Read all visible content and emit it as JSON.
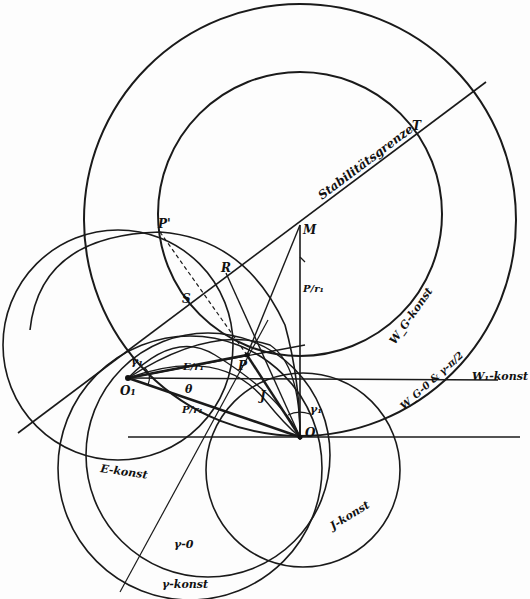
{
  "diagram": {
    "stroke_color": "#1a1a1a",
    "background": "#fdfdfd",
    "points": {
      "O": {
        "label": "O",
        "x": 300,
        "y": 437
      },
      "O1": {
        "label": "O₁",
        "x": 128,
        "y": 378
      },
      "P": {
        "label": "P",
        "x": 247,
        "y": 355
      },
      "P_prime": {
        "label": "P'",
        "x": 160,
        "y": 232
      },
      "M": {
        "label": "M",
        "x": 300,
        "y": 225
      },
      "R": {
        "label": "R",
        "x": 226,
        "y": 273
      },
      "S": {
        "label": "S",
        "x": 183,
        "y": 305
      },
      "T": {
        "label": "T",
        "x": 414,
        "y": 130
      }
    },
    "labels": {
      "stability": "Stabilitätsgrenze",
      "w1_konst": "W₁-konst",
      "wg_konst": "W_G-konst",
      "wg_zero": "W_G-0 & γ-π/2",
      "e_konst": "E-konst",
      "j_konst": "J-konst",
      "gamma_zero": "γ-0",
      "gamma_konst": "γ-konst",
      "p_over_r1": "P/r₁",
      "e_over_r1": "E/r₁",
      "theta": "θ",
      "gamma1_a": "γ₁",
      "gamma1_b": "γ₁",
      "j_sym": "J",
      "p_over_r1_b": "P/r₁"
    },
    "circles": [
      {
        "name": "w1-konst",
        "cx": 300,
        "cy": 220,
        "r": 215
      },
      {
        "name": "wg-konst",
        "cx": 300,
        "cy": 214,
        "r": 142
      },
      {
        "name": "e-konst",
        "cx": 108,
        "cy": 330,
        "r": 112
      },
      {
        "name": "j-konst",
        "cx": 300,
        "cy": 495,
        "r": 98
      },
      {
        "name": "gamma-zero",
        "cx": 215,
        "cy": 450,
        "r": 128
      },
      {
        "name": "gamma-konst",
        "cx": 210,
        "cy": 460,
        "r": 132
      },
      {
        "name": "wg-zero-arc",
        "cx": 225,
        "cy": 240,
        "r": 200
      }
    ]
  }
}
